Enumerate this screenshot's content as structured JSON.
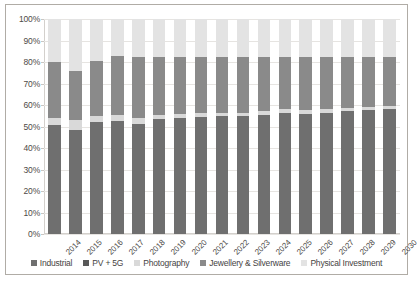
{
  "chart_data": {
    "type": "bar",
    "stacked": true,
    "stack_mode": "percent",
    "title": "",
    "subtitle": "",
    "xlabel": "",
    "ylabel": "",
    "ylim": [
      0,
      100
    ],
    "ytick_labels": [
      "100%",
      "90%",
      "80%",
      "70%",
      "60%",
      "50%",
      "40%",
      "30%",
      "20%",
      "10%",
      "0%"
    ],
    "ytick_values": [
      100,
      90,
      80,
      70,
      60,
      50,
      40,
      30,
      20,
      10,
      0
    ],
    "grid": true,
    "legend_position": "bottom",
    "categories": [
      "2014",
      "2015",
      "2016",
      "2017",
      "2018",
      "2019",
      "2020",
      "2021",
      "2022",
      "2023",
      "2024",
      "2025",
      "2026",
      "2027",
      "2028",
      "2029",
      "2030"
    ],
    "series": [
      {
        "name": "Industrial",
        "color": "#6f6f6f",
        "values": [
          50.5,
          48.5,
          52.0,
          52.5,
          51.0,
          53.5,
          54.0,
          54.5,
          55.0,
          55.0,
          55.5,
          56.5,
          56.0,
          56.5,
          57.0,
          57.5,
          58.0
        ]
      },
      {
        "name": "PV + 5G",
        "color": "#6f6f6f",
        "values": [
          0,
          0,
          0,
          0,
          0,
          0,
          0,
          0,
          0,
          0,
          0,
          0,
          0,
          0,
          0,
          0,
          0
        ]
      },
      {
        "name": "Photography",
        "color": "#d9d9d9",
        "values": [
          3.5,
          4.5,
          3.0,
          3.0,
          3.0,
          2.0,
          2.0,
          2.0,
          1.5,
          1.5,
          1.5,
          1.5,
          1.5,
          1.5,
          1.5,
          1.5,
          1.5
        ]
      },
      {
        "name": "Jewellery & Silverware",
        "color": "#8a8a8a",
        "values": [
          26.0,
          23.0,
          25.5,
          27.5,
          28.5,
          27.0,
          26.5,
          26.0,
          26.0,
          26.0,
          25.5,
          24.5,
          25.0,
          24.5,
          24.0,
          23.5,
          23.0
        ]
      },
      {
        "name": "Physical Investment",
        "color": "#e3e3e3",
        "values": [
          20.0,
          24.0,
          19.5,
          17.0,
          17.5,
          17.5,
          17.5,
          17.5,
          17.5,
          17.5,
          17.5,
          17.5,
          17.5,
          17.5,
          17.5,
          17.5,
          17.5
        ]
      }
    ]
  },
  "legend": {
    "items": [
      {
        "label": "Industrial",
        "color": "#6f6f6f"
      },
      {
        "label": "PV + 5G",
        "color": "#585858"
      },
      {
        "label": "Photography",
        "color": "#d9d9d9"
      },
      {
        "label": "Jewellery & Silverware",
        "color": "#8a8a8a"
      },
      {
        "label": "Physical Investment",
        "color": "#e3e3e3"
      }
    ]
  },
  "style": {
    "border_color": "#b0aca6",
    "grid_color": "#e6e4e1",
    "text_color": "#4d4a47",
    "background": "#ffffff"
  }
}
